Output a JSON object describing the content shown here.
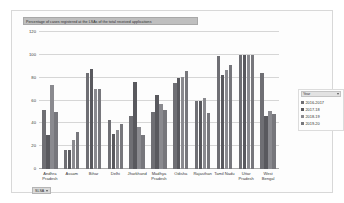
{
  "chart_data": {
    "type": "bar",
    "title": "Percentage of cases registered at the LSAs of the total received applications",
    "xlabel": "",
    "ylabel": "",
    "ylim": [
      0,
      120
    ],
    "yticks": [
      0,
      20,
      40,
      60,
      80,
      100,
      120
    ],
    "grid": true,
    "legend_position": "right",
    "categories": [
      "Andhra Pradesh",
      "Assam",
      "Bihar",
      "Delhi",
      "Jharkhand",
      "Madhya Pradesh",
      "Odisha",
      "Rajasthan",
      "Tamil Nadu",
      "Uttar Pradesh",
      "West Bengal"
    ],
    "series": [
      {
        "name": "2016-2017",
        "color": "#6f6f74",
        "values": [
          52,
          17,
          84,
          43,
          46,
          50,
          75,
          60,
          99,
          100,
          84
        ]
      },
      {
        "name": "2017-18",
        "color": "#59595e",
        "values": [
          30,
          17,
          88,
          31,
          76,
          65,
          80,
          60,
          82,
          100,
          46
        ]
      },
      {
        "name": "2018-19",
        "color": "#8a8a8f",
        "values": [
          74,
          25,
          70,
          34,
          37,
          57,
          81,
          62,
          87,
          100,
          51
        ]
      },
      {
        "name": "2019-20",
        "color": "#77777c",
        "values": [
          50,
          32,
          70,
          39,
          30,
          52,
          86,
          49,
          91,
          100,
          48
        ]
      }
    ]
  },
  "legend": {
    "header_label": "Year",
    "caret_icon": "chevron-down-icon"
  },
  "filter": {
    "label": "SLSA",
    "caret_icon": "chevron-down-icon"
  }
}
